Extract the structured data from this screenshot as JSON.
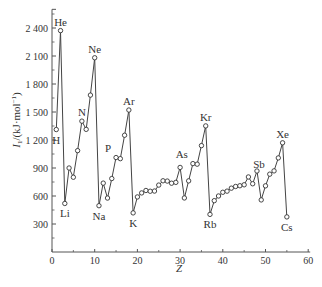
{
  "chart_data": {
    "type": "line",
    "title": "",
    "xlabel": "Z",
    "ylabel": "I1/(kJ·mol⁻¹)",
    "xlim": [
      0,
      60
    ],
    "ylim": [
      0,
      2600
    ],
    "x_ticks": [
      0,
      10,
      20,
      30,
      40,
      50,
      60
    ],
    "y_ticks": [
      300,
      600,
      900,
      1200,
      1500,
      1800,
      2100,
      2400
    ],
    "y_tick_labels": [
      "300",
      "600",
      "900",
      "1 200",
      "1 500",
      "1 800",
      "2 100",
      "2 400"
    ],
    "grid": false,
    "legend": null,
    "series": [
      {
        "name": "First ionization energy",
        "x": [
          1,
          2,
          3,
          4,
          5,
          6,
          7,
          8,
          9,
          10,
          11,
          12,
          13,
          14,
          15,
          16,
          17,
          18,
          19,
          20,
          21,
          22,
          23,
          24,
          25,
          26,
          27,
          28,
          29,
          30,
          31,
          32,
          33,
          34,
          35,
          36,
          37,
          38,
          39,
          40,
          41,
          42,
          43,
          44,
          45,
          46,
          47,
          48,
          49,
          50,
          51,
          52,
          53,
          54,
          55
        ],
        "values": [
          1312,
          2372,
          520,
          900,
          801,
          1086,
          1402,
          1314,
          1681,
          2081,
          496,
          738,
          578,
          787,
          1012,
          1000,
          1251,
          1521,
          419,
          590,
          633,
          659,
          651,
          653,
          717,
          763,
          760,
          737,
          746,
          906,
          579,
          762,
          947,
          941,
          1140,
          1351,
          403,
          550,
          600,
          640,
          652,
          684,
          702,
          710,
          720,
          804,
          731,
          868,
          558,
          709,
          834,
          869,
          1008,
          1170,
          376
        ]
      }
    ],
    "annotations": [
      {
        "label": "H",
        "z": 1,
        "pos": "below"
      },
      {
        "label": "He",
        "z": 2,
        "pos": "above"
      },
      {
        "label": "Li",
        "z": 3,
        "pos": "below"
      },
      {
        "label": "N",
        "z": 7,
        "pos": "above"
      },
      {
        "label": "Ne",
        "z": 10,
        "pos": "above"
      },
      {
        "label": "Na",
        "z": 11,
        "pos": "below"
      },
      {
        "label": "P",
        "z": 15,
        "pos": "above-left"
      },
      {
        "label": "Ar",
        "z": 18,
        "pos": "above"
      },
      {
        "label": "K",
        "z": 19,
        "pos": "below"
      },
      {
        "label": "As",
        "z": 33,
        "pos": "above-left"
      },
      {
        "label": "Kr",
        "z": 36,
        "pos": "above"
      },
      {
        "label": "Rb",
        "z": 37,
        "pos": "below"
      },
      {
        "label": "Sb",
        "z": 51,
        "pos": "above-left"
      },
      {
        "label": "Xe",
        "z": 54,
        "pos": "above"
      },
      {
        "label": "Cs",
        "z": 55,
        "pos": "below"
      }
    ]
  }
}
